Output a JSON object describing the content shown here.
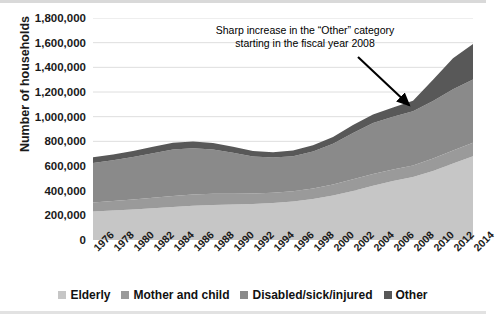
{
  "chart_data": {
    "type": "area",
    "stacked": true,
    "title": "",
    "xlabel": "",
    "ylabel": "Number of households",
    "ylim": [
      0,
      1800000
    ],
    "ytick_step": 200000,
    "ytick_labels": [
      "1,800,000",
      "1,600,000",
      "1,400,000",
      "1,200,000",
      "1,000,000",
      "800,000",
      "600,000",
      "400,000",
      "200,000",
      "0"
    ],
    "grid": true,
    "legend_position": "bottom",
    "categories": [
      1976,
      1978,
      1980,
      1982,
      1984,
      1986,
      1988,
      1990,
      1992,
      1994,
      1996,
      1998,
      2000,
      2002,
      2004,
      2006,
      2008,
      2010,
      2012,
      2014
    ],
    "xtick_labels": [
      "1976",
      "1978",
      "1980",
      "1982",
      "1984",
      "1986",
      "1988",
      "1990",
      "1992",
      "1994",
      "1996",
      "1998",
      "2000",
      "2002",
      "2004",
      "2006",
      "2008",
      "2010",
      "2012",
      "2014"
    ],
    "series": [
      {
        "name": "Elderly",
        "color": "#c6c6c6",
        "values": [
          232000,
          240000,
          248000,
          258000,
          268000,
          278000,
          284000,
          288000,
          292000,
          300000,
          312000,
          332000,
          360000,
          398000,
          440000,
          478000,
          510000,
          560000,
          620000,
          680000
        ]
      },
      {
        "name": "Mother and child",
        "color": "#9a9a9a",
        "values": [
          72000,
          76000,
          80000,
          84000,
          88000,
          90000,
          90000,
          88000,
          86000,
          84000,
          84000,
          86000,
          90000,
          94000,
          96000,
          94000,
          94000,
          100000,
          106000,
          108000
        ]
      },
      {
        "name": "Disabled/sick/injured",
        "color": "#8a8a8a",
        "values": [
          320000,
          330000,
          344000,
          362000,
          378000,
          376000,
          360000,
          332000,
          300000,
          284000,
          284000,
          300000,
          330000,
          376000,
          412000,
          428000,
          440000,
          468000,
          496000,
          514000
        ]
      },
      {
        "name": "Other",
        "color": "#585858",
        "values": [
          46000,
          48000,
          50000,
          52000,
          54000,
          54000,
          52000,
          48000,
          44000,
          44000,
          46000,
          50000,
          56000,
          64000,
          70000,
          74000,
          86000,
          172000,
          252000,
          288000
        ]
      }
    ],
    "annotations": [
      {
        "text": "Sharp increase in the “Other” category starting in the fiscal year 2008",
        "line1": "Sharp increase in the “Other” category",
        "line2": "starting in the fiscal year 2008",
        "points_to_year": 2008
      }
    ]
  },
  "legend": {
    "items": [
      {
        "label": "Elderly",
        "color": "#c6c6c6"
      },
      {
        "label": "Mother and child",
        "color": "#9a9a9a"
      },
      {
        "label": "Disabled/sick/injured",
        "color": "#8a8a8a"
      },
      {
        "label": "Other",
        "color": "#585858"
      }
    ]
  },
  "axis": {
    "y_title": "Number of households"
  }
}
